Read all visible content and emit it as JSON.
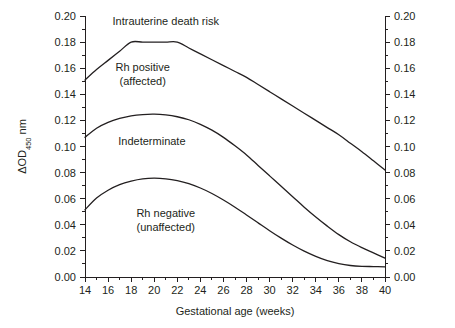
{
  "chart_data": {
    "type": "line",
    "title": "",
    "subtitle": "",
    "xlabel": "Gestational age (weeks)",
    "ylabel": "ΔOD450 nm",
    "ylabel_main": "ΔOD",
    "ylabel_sub": "450",
    "ylabel_unit": "nm",
    "xlim": [
      14,
      40
    ],
    "ylim": [
      0.0,
      0.2
    ],
    "xticks": [
      14,
      16,
      18,
      20,
      22,
      24,
      26,
      28,
      30,
      32,
      34,
      36,
      38,
      40
    ],
    "xtick_labels": [
      "14",
      "16",
      "18",
      "20",
      "22",
      "24",
      "26",
      "28",
      "30",
      "32",
      "34",
      "36",
      "38",
      "40"
    ],
    "x_minor_ticks": [
      15,
      17,
      19,
      21,
      23,
      25,
      27,
      29,
      31,
      33,
      35,
      37,
      39
    ],
    "yticks": [
      0.0,
      0.02,
      0.04,
      0.06,
      0.08,
      0.1,
      0.12,
      0.14,
      0.16,
      0.18,
      0.2
    ],
    "ytick_labels": [
      "0.00",
      "0.02",
      "0.04",
      "0.06",
      "0.08",
      "0.10",
      "0.12",
      "0.14",
      "0.16",
      "0.18",
      "0.20"
    ],
    "y_minor_ticks": [
      0.01,
      0.03,
      0.05,
      0.07,
      0.09,
      0.11,
      0.13,
      0.15,
      0.17,
      0.19
    ],
    "left_axis_labels": [
      "0.20",
      "0.18",
      "0.16",
      "0.14",
      "0.12",
      "0.10",
      "0.08",
      "0.06",
      "0.04",
      "0.02",
      "0.00"
    ],
    "right_axis_labels": [
      "0.20",
      "0.18",
      "0.16",
      "0.14",
      "0.12",
      "0.10",
      "0.08",
      "0.06",
      "0.04",
      "0.02",
      "0.00"
    ],
    "grid": false,
    "legend": "none",
    "series": [
      {
        "name": "upper-boundary",
        "description": "Boundary between Intrauterine death risk zone and Rh positive (affected) zone",
        "x": [
          14,
          15,
          16,
          17,
          18,
          19,
          20,
          21,
          22,
          23,
          24,
          25,
          26,
          27,
          28,
          29,
          30,
          31,
          32,
          33,
          34,
          35,
          36,
          37,
          38,
          39,
          40
        ],
        "values": [
          0.151,
          0.159,
          0.166,
          0.173,
          0.18,
          0.18,
          0.18,
          0.18,
          0.18,
          0.1755,
          0.171,
          0.1665,
          0.162,
          0.1575,
          0.153,
          0.1475,
          0.142,
          0.1365,
          0.131,
          0.1255,
          0.12,
          0.1145,
          0.109,
          0.1025,
          0.096,
          0.089,
          0.082
        ]
      },
      {
        "name": "middle-boundary",
        "description": "Boundary between Rh positive (affected) zone and Indeterminate zone",
        "x": [
          14,
          15,
          16,
          17,
          18,
          19,
          20,
          21,
          22,
          23,
          24,
          25,
          26,
          27,
          28,
          29,
          30,
          31,
          32,
          33,
          34,
          35,
          36,
          37,
          38,
          39,
          40
        ],
        "values": [
          0.107,
          0.114,
          0.1185,
          0.1215,
          0.1235,
          0.1245,
          0.1248,
          0.1242,
          0.1228,
          0.1205,
          0.117,
          0.1125,
          0.107,
          0.1005,
          0.0935,
          0.0855,
          0.0775,
          0.0695,
          0.0615,
          0.0535,
          0.046,
          0.039,
          0.0325,
          0.027,
          0.0225,
          0.0185,
          0.0145
        ]
      },
      {
        "name": "lower-boundary",
        "description": "Boundary between Indeterminate zone and Rh negative (unaffected) zone",
        "x": [
          14,
          15,
          16,
          17,
          18,
          19,
          20,
          21,
          22,
          23,
          24,
          25,
          26,
          27,
          28,
          29,
          30,
          31,
          32,
          33,
          34,
          35,
          36,
          37,
          38,
          39,
          40
        ],
        "values": [
          0.0515,
          0.0605,
          0.0665,
          0.0708,
          0.0735,
          0.0752,
          0.0757,
          0.0752,
          0.0738,
          0.0715,
          0.0682,
          0.064,
          0.059,
          0.0535,
          0.0475,
          0.0415,
          0.0355,
          0.0298,
          0.0245,
          0.0198,
          0.0158,
          0.0125,
          0.0102,
          0.0088,
          0.0082,
          0.008,
          0.0078
        ]
      }
    ],
    "annotations": [
      {
        "name": "intrauterine-death-risk",
        "text": "Intrauterine death risk",
        "x": 21.0,
        "y": 0.193
      },
      {
        "name": "rh-positive",
        "line1": "Rh positive",
        "line2": "(affected)",
        "x": 19.0,
        "y": 0.158
      },
      {
        "name": "indeterminate",
        "text": "Indeterminate",
        "x": 19.8,
        "y": 0.101
      },
      {
        "name": "rh-negative",
        "line1": "Rh negative",
        "line2": "(unaffected)",
        "x": 21.0,
        "y": 0.046
      }
    ],
    "colors": {
      "curve": "#231f20",
      "axis": "#231f20",
      "text": "#231f20",
      "background": "#ffffff"
    }
  }
}
